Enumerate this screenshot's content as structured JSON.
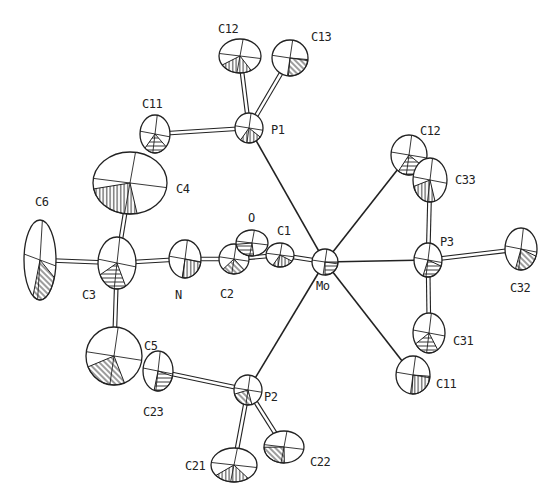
{
  "diagram": {
    "type": "ORTEP molecular structure",
    "central_atom": "Mo",
    "atoms": [
      {
        "id": "Mo",
        "label": "Mo",
        "x": 325,
        "y": 262,
        "rx": 13,
        "ry": 13
      },
      {
        "id": "P1",
        "label": "P1",
        "x": 249,
        "y": 128,
        "rx": 14,
        "ry": 15
      },
      {
        "id": "P2",
        "label": "P2",
        "x": 248,
        "y": 390,
        "rx": 14,
        "ry": 15
      },
      {
        "id": "P3",
        "label": "P3",
        "x": 428,
        "y": 260,
        "rx": 14,
        "ry": 17
      },
      {
        "id": "C12a",
        "label": "C12",
        "x": 240,
        "y": 56,
        "rx": 21,
        "ry": 17
      },
      {
        "id": "C13",
        "label": "C13",
        "x": 290,
        "y": 58,
        "rx": 18,
        "ry": 18
      },
      {
        "id": "C11a",
        "label": "C11",
        "x": 155,
        "y": 134,
        "rx": 15,
        "ry": 19
      },
      {
        "id": "C4",
        "label": "C4",
        "x": 130,
        "y": 183,
        "rx": 37,
        "ry": 31
      },
      {
        "id": "C6",
        "label": "C6",
        "x": 40,
        "y": 260,
        "rx": 16,
        "ry": 40
      },
      {
        "id": "C3",
        "label": "C3",
        "x": 117,
        "y": 263,
        "rx": 19,
        "ry": 26
      },
      {
        "id": "N",
        "label": "N",
        "x": 185,
        "y": 259,
        "rx": 16,
        "ry": 19
      },
      {
        "id": "C2",
        "label": "C2",
        "x": 234,
        "y": 259,
        "rx": 15,
        "ry": 15
      },
      {
        "id": "O",
        "label": "O",
        "x": 252,
        "y": 243,
        "rx": 16,
        "ry": 13
      },
      {
        "id": "C1",
        "label": "C1",
        "x": 280,
        "y": 255,
        "rx": 14,
        "ry": 12
      },
      {
        "id": "C5",
        "label": "C5",
        "x": 114,
        "y": 356,
        "rx": 28,
        "ry": 29
      },
      {
        "id": "C23",
        "label": "C23",
        "x": 158,
        "y": 371,
        "rx": 15,
        "ry": 20
      },
      {
        "id": "C21",
        "label": "C21",
        "x": 234,
        "y": 465,
        "rx": 23,
        "ry": 17
      },
      {
        "id": "C22",
        "label": "C22",
        "x": 284,
        "y": 447,
        "rx": 20,
        "ry": 16
      },
      {
        "id": "C12b",
        "label": "C12",
        "x": 409,
        "y": 155,
        "rx": 18,
        "ry": 20
      },
      {
        "id": "C33",
        "label": "C33",
        "x": 430,
        "y": 180,
        "rx": 17,
        "ry": 22
      },
      {
        "id": "C32",
        "label": "C32",
        "x": 521,
        "y": 249,
        "rx": 16,
        "ry": 21
      },
      {
        "id": "C31",
        "label": "C31",
        "x": 429,
        "y": 333,
        "rx": 16,
        "ry": 20
      },
      {
        "id": "C11b",
        "label": "C11",
        "x": 413,
        "y": 375,
        "rx": 17,
        "ry": 19
      }
    ],
    "bonds": [
      {
        "from": "Mo",
        "to": "P1",
        "style": "thin"
      },
      {
        "from": "Mo",
        "to": "P2",
        "style": "thin"
      },
      {
        "from": "Mo",
        "to": "P3",
        "style": "thin"
      },
      {
        "from": "Mo",
        "to": "C12b",
        "style": "thin"
      },
      {
        "from": "Mo",
        "to": "C11b",
        "style": "thin"
      },
      {
        "from": "Mo",
        "to": "C1",
        "style": "double"
      },
      {
        "from": "P1",
        "to": "C12a",
        "style": "double"
      },
      {
        "from": "P1",
        "to": "C13",
        "style": "double"
      },
      {
        "from": "P1",
        "to": "C11a",
        "style": "double"
      },
      {
        "from": "P2",
        "to": "C23",
        "style": "double"
      },
      {
        "from": "P2",
        "to": "C21",
        "style": "double"
      },
      {
        "from": "P2",
        "to": "C22",
        "style": "double"
      },
      {
        "from": "P3",
        "to": "C33",
        "style": "double"
      },
      {
        "from": "P3",
        "to": "C32",
        "style": "double"
      },
      {
        "from": "P3",
        "to": "C31",
        "style": "double"
      },
      {
        "from": "C3",
        "to": "C4",
        "style": "double"
      },
      {
        "from": "C3",
        "to": "C5",
        "style": "double"
      },
      {
        "from": "C3",
        "to": "C6",
        "style": "double"
      },
      {
        "from": "C3",
        "to": "N",
        "style": "double"
      },
      {
        "from": "N",
        "to": "C2",
        "style": "double"
      },
      {
        "from": "C2",
        "to": "C1",
        "style": "double"
      }
    ],
    "labels": [
      {
        "text": "C12",
        "x": 218,
        "y": 33
      },
      {
        "text": "C13",
        "x": 311,
        "y": 41
      },
      {
        "text": "C11",
        "x": 142,
        "y": 108
      },
      {
        "text": "P1",
        "x": 271,
        "y": 134
      },
      {
        "text": "C4",
        "x": 176,
        "y": 193
      },
      {
        "text": "C6",
        "x": 35,
        "y": 206
      },
      {
        "text": "O",
        "x": 248,
        "y": 222
      },
      {
        "text": "C1",
        "x": 277,
        "y": 235
      },
      {
        "text": "C3",
        "x": 82,
        "y": 299
      },
      {
        "text": "N",
        "x": 175,
        "y": 299
      },
      {
        "text": "C2",
        "x": 220,
        "y": 298
      },
      {
        "text": "Mo",
        "x": 316,
        "y": 290
      },
      {
        "text": "C12",
        "x": 420,
        "y": 135
      },
      {
        "text": "C33",
        "x": 455,
        "y": 184
      },
      {
        "text": "P3",
        "x": 440,
        "y": 246
      },
      {
        "text": "C32",
        "x": 510,
        "y": 292
      },
      {
        "text": "C31",
        "x": 453,
        "y": 345
      },
      {
        "text": "C11",
        "x": 436,
        "y": 388
      },
      {
        "text": "C5",
        "x": 144,
        "y": 350
      },
      {
        "text": "C23",
        "x": 143,
        "y": 416
      },
      {
        "text": "P2",
        "x": 264,
        "y": 401
      },
      {
        "text": "C21",
        "x": 185,
        "y": 470
      },
      {
        "text": "C22",
        "x": 310,
        "y": 466
      }
    ],
    "colors": {
      "ink": "#222222",
      "background": "#ffffff"
    }
  }
}
